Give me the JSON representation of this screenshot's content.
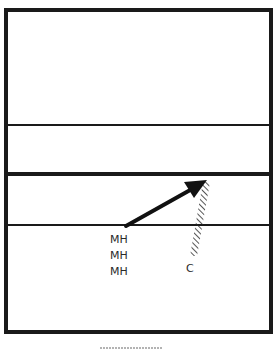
{
  "diagram": {
    "type": "court-play-diagram",
    "court": {
      "border_color": "#1a1a1a",
      "lines": [
        {
          "name": "upper-line",
          "y": 125,
          "weight": "thin"
        },
        {
          "name": "center-line",
          "y": 174,
          "weight": "thick"
        },
        {
          "name": "attack-line",
          "y": 225,
          "weight": "thin"
        }
      ]
    },
    "players": [
      {
        "id": "mh-1",
        "label": "MH"
      },
      {
        "id": "mh-2",
        "label": "MH"
      },
      {
        "id": "mh-3",
        "label": "MH"
      },
      {
        "id": "c",
        "label": "C"
      }
    ],
    "arrow": {
      "from": [
        126,
        226
      ],
      "to": [
        206,
        181
      ],
      "meaning": "movement path"
    },
    "hatched_zone": {
      "meaning": "blocking/coverage zone"
    }
  }
}
